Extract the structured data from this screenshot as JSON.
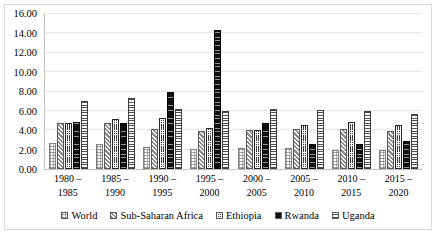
{
  "chart_data": {
    "type": "bar",
    "title": "",
    "subtitle": "",
    "xlabel": "",
    "ylabel": "",
    "ylim": [
      0,
      16
    ],
    "ytick_labels": [
      "16.00",
      "14.00",
      "12.00",
      "10.00",
      "8.00",
      "6.00",
      "4.00",
      "2.00",
      "0.00"
    ],
    "ytick_values": [
      16,
      14,
      12,
      10,
      8,
      6,
      4,
      2,
      0
    ],
    "grid": true,
    "legend_position": "bottom",
    "categories": [
      "1980 – 1985",
      "1985 – 1990",
      "1990 – 1995",
      "1995 – 2000",
      "2000 – 2005",
      "2005 – 2010",
      "2010 – 2015",
      "2015 – 2020"
    ],
    "category_lines": [
      {
        "l1": "1980 –",
        "l2": "1985"
      },
      {
        "l1": "1985 –",
        "l2": "1990"
      },
      {
        "l1": "1990 –",
        "l2": "1995"
      },
      {
        "l1": "1995 –",
        "l2": "2000"
      },
      {
        "l1": "2000 –",
        "l2": "2005"
      },
      {
        "l1": "2005 –",
        "l2": "2010"
      },
      {
        "l1": "2010 –",
        "l2": "2015"
      },
      {
        "l1": "2015 –",
        "l2": "2020"
      }
    ],
    "series": [
      {
        "name": "World",
        "key": "world",
        "values": [
          2.7,
          2.6,
          2.3,
          2.1,
          2.2,
          2.2,
          2.0,
          1.95
        ]
      },
      {
        "name": "Sub-Saharan Africa",
        "key": "ssa",
        "values": [
          4.75,
          4.75,
          4.15,
          3.9,
          4.0,
          4.1,
          4.1,
          3.95
        ]
      },
      {
        "name": "Ethiopia",
        "key": "eth",
        "values": [
          4.8,
          5.2,
          5.3,
          4.2,
          4.0,
          4.55,
          4.85,
          4.55
        ]
      },
      {
        "name": "Rwanda",
        "key": "rwa",
        "values": [
          4.85,
          4.7,
          8.0,
          14.3,
          4.7,
          2.6,
          2.6,
          2.85
        ]
      },
      {
        "name": "Uganda",
        "key": "uga",
        "values": [
          7.0,
          7.3,
          6.2,
          6.0,
          6.2,
          6.1,
          5.95,
          5.7
        ]
      }
    ]
  },
  "legend": {
    "items": [
      {
        "label": "World"
      },
      {
        "label": "Sub-Saharan Africa"
      },
      {
        "label": "Ethiopia"
      },
      {
        "label": "Rwanda"
      },
      {
        "label": "Uganda"
      }
    ]
  }
}
